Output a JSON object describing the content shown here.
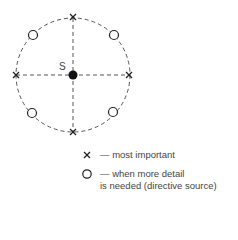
{
  "diagram": {
    "center_label": "S",
    "points": {
      "most_important": [
        "top",
        "right",
        "bottom",
        "left"
      ],
      "more_detail": [
        "top-left",
        "top-right",
        "bottom-left",
        "bottom-right"
      ]
    }
  },
  "legend": [
    {
      "symbol": "cross-icon",
      "text": "— most important"
    },
    {
      "symbol": "circle-icon",
      "text_line1": "— when more detail",
      "text_line2": "is needed (directive source)"
    }
  ]
}
